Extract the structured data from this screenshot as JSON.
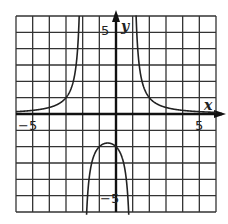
{
  "chart_data": {
    "type": "line",
    "title": "",
    "xlabel": "x",
    "ylabel": "y",
    "xlim": [
      -6,
      6
    ],
    "ylim": [
      -6,
      6
    ],
    "grid": true,
    "grid_step": 1,
    "tick_labels": {
      "x": [
        "-5",
        "5"
      ],
      "y": [
        "5",
        "-5"
      ]
    },
    "vertical_asymptotes": [
      -2,
      1
    ],
    "horizontal_asymptote": 0,
    "function_estimate": "y = 4 / ((x + 2)(x - 1))",
    "series": [
      {
        "name": "left branch",
        "x": [
          -6,
          -5,
          -4,
          -3,
          -2.5,
          -2.3
        ],
        "values": [
          0.14,
          0.22,
          0.4,
          1.0,
          2.29,
          4.44
        ]
      },
      {
        "name": "middle branch",
        "x": [
          -1.9,
          -1.5,
          -1,
          -0.5,
          0,
          0.5,
          0.9
        ],
        "values": [
          -13.8,
          -3.2,
          -2.0,
          -1.78,
          -2.0,
          -3.2,
          -14.3
        ]
      },
      {
        "name": "right branch",
        "x": [
          1.2,
          1.5,
          2,
          3,
          4,
          5,
          6
        ],
        "values": [
          6.25,
          2.29,
          1.0,
          0.4,
          0.22,
          0.14,
          0.1
        ]
      }
    ]
  },
  "labels": {
    "x_axis": "x",
    "y_axis": "y",
    "x_neg": "−5",
    "x_pos": "5",
    "y_pos": "5",
    "y_neg": "−5"
  }
}
